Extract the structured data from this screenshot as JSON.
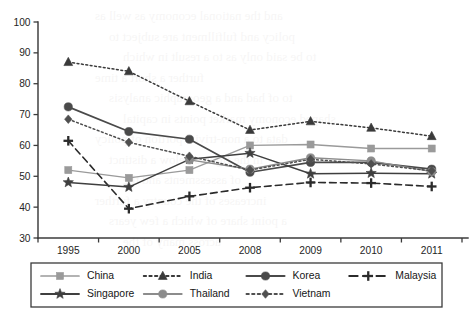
{
  "chart_data": {
    "type": "line",
    "title": "",
    "subtitle": "",
    "xlabel": "",
    "ylabel": "",
    "categories": [
      "1995",
      "2000",
      "2005",
      "2008",
      "2009",
      "2010",
      "2011"
    ],
    "ylim": [
      30,
      100
    ],
    "yticks": [
      30,
      40,
      50,
      60,
      70,
      80,
      90,
      100
    ],
    "ytick_labels": [
      "30",
      "40",
      "50",
      "60",
      "70",
      "80",
      "90",
      "100"
    ],
    "grid": false,
    "legend_position": "bottom",
    "legend_columns": 4,
    "series": [
      {
        "name": "China",
        "color": "#9a9a9a",
        "marker": "square",
        "line_style": "solid",
        "line_width": 1.3,
        "values": [
          52.0,
          49.5,
          52.0,
          60.0,
          60.3,
          59.0,
          59.0
        ]
      },
      {
        "name": "India",
        "color": "#3a3a3a",
        "marker": "triangle",
        "line_style": "dotted",
        "line_width": 1.5,
        "values": [
          87.0,
          84.0,
          74.3,
          65.0,
          67.8,
          65.7,
          63.0
        ]
      },
      {
        "name": "Korea",
        "color": "#4a4a4a",
        "marker": "circle",
        "line_style": "solid",
        "line_width": 1.7,
        "values": [
          72.5,
          64.5,
          62.0,
          51.3,
          54.5,
          54.5,
          52.3
        ]
      },
      {
        "name": "Malaysia",
        "color": "#2b2b2b",
        "marker": "plus",
        "line_style": "dashed",
        "line_width": 1.6,
        "values": [
          61.5,
          39.5,
          43.5,
          46.3,
          48.0,
          47.8,
          46.7
        ]
      },
      {
        "name": "Singapore",
        "color": "#3f3f3f",
        "marker": "star",
        "line_style": "solid",
        "line_width": 1.5,
        "values": [
          48.0,
          46.5,
          55.5,
          57.5,
          50.8,
          51.0,
          50.8
        ]
      },
      {
        "name": "Thailand",
        "color": "#8c8c8c",
        "marker": "circle",
        "line_style": "solid",
        "line_width": 1.4,
        "values": [
          null,
          null,
          55.3,
          52.3,
          56.0,
          55.0,
          51.5
        ]
      },
      {
        "name": "Vietnam",
        "color": "#4f4f4f",
        "marker": "diamond",
        "line_style": "dotted",
        "line_width": 1.5,
        "values": [
          68.5,
          61.0,
          56.5,
          52.0,
          55.5,
          54.0,
          51.8
        ]
      }
    ]
  },
  "legend": {
    "entries": [
      {
        "label": "China"
      },
      {
        "label": "India"
      },
      {
        "label": "Korea"
      },
      {
        "label": "Malaysia"
      },
      {
        "label": "Singapore"
      },
      {
        "label": "Thailand"
      },
      {
        "label": "Vietnam"
      }
    ]
  },
  "background_bleed": {
    "lines": [
      "and the national economy as well as",
      "policy and fulfillment are subject to",
      "to be said only as to a result in which",
      "further a short a time",
      "to of had and a geographic analysis",
      "shaped economy market points in capital",
      "data to a non-trivial portion of policy",
      "in the figures below a distinct",
      "of assessments and the",
      "increases of the country a further",
      "a point share of which a few years",
      "across many of the"
    ]
  }
}
